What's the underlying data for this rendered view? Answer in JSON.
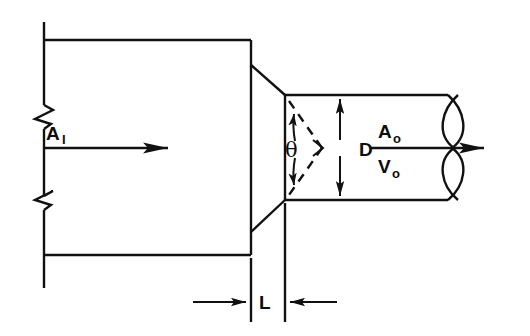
{
  "figure": {
    "type": "engineering-line-diagram",
    "background_color": "#ffffff",
    "line_color": "#111111"
  },
  "labels": {
    "inlet_area": {
      "symbol": "A",
      "subscript": "I",
      "x": 46,
      "y": 135
    },
    "outlet_area": {
      "symbol": "A",
      "subscript": "o",
      "x": 380,
      "y": 133
    },
    "outlet_velocity": {
      "symbol": "V",
      "subscript": "o",
      "x": 380,
      "y": 166
    },
    "cone_angle": {
      "symbol": "θ",
      "x": 291,
      "y": 158
    },
    "outlet_diameter": {
      "symbol": "D",
      "x": 347,
      "y": 154
    },
    "nozzle_length": {
      "symbol": "L",
      "x": 258,
      "y": 308
    }
  },
  "geometry": {
    "inlet_duct": {
      "left_boundary_x": 44,
      "top_wall_y": 40,
      "bottom_wall_y": 255,
      "right_face_x": 251
    },
    "taper": {
      "top_start": [
        251,
        65
      ],
      "top_end": [
        285,
        95
      ],
      "bottom_start": [
        251,
        232
      ],
      "bottom_end": [
        285,
        200
      ]
    },
    "outlet_pipe": {
      "top_wall_y": 95,
      "bottom_wall_y": 200,
      "start_x": 285,
      "end_x": 455
    },
    "centerline_y": 148,
    "break_symbol_left_x": 44,
    "break_symbol_y_upper": 105,
    "break_symbol_y_lower": 205,
    "dimension_line_L_y": 302
  },
  "arrows": {
    "inlet_flow": {
      "from": [
        44,
        148
      ],
      "to": [
        194,
        148
      ],
      "direction": "right"
    },
    "outlet_flow": {
      "from": [
        370,
        148
      ],
      "to": [
        510,
        148
      ],
      "direction": "right"
    },
    "diameter_upper": {
      "from": [
        340,
        148
      ],
      "to": [
        340,
        95
      ],
      "direction": "up"
    },
    "diameter_lower": {
      "from": [
        340,
        148
      ],
      "to": [
        340,
        200
      ],
      "direction": "down"
    },
    "length_left": {
      "from": [
        193,
        302
      ],
      "to": [
        234,
        302
      ],
      "direction": "right"
    },
    "length_right": {
      "from": [
        326,
        302
      ],
      "to": [
        287,
        302
      ],
      "direction": "left"
    },
    "theta_upper": {
      "direction": "up"
    },
    "theta_lower": {
      "direction": "down"
    }
  }
}
